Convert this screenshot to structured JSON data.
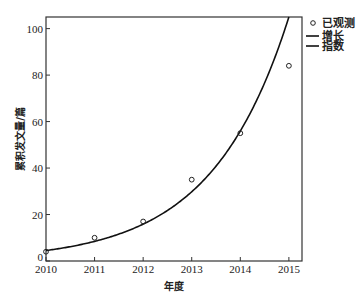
{
  "chart_data": {
    "type": "scatter",
    "title": "",
    "xlabel": "年度",
    "ylabel": "累积发文量/篇",
    "xlim": [
      2010,
      2015.27
    ],
    "ylim": [
      0,
      105
    ],
    "xticks": [
      2010,
      2011,
      2012,
      2013,
      2014,
      2015
    ],
    "yticks": [
      0,
      20,
      40,
      60,
      80,
      100
    ],
    "grid": false,
    "legend_position": "top-right-outside",
    "series": [
      {
        "name": "已观测",
        "type": "scatter",
        "marker": "open-circle",
        "x": [
          2010,
          2011,
          2012,
          2013,
          2014,
          2015
        ],
        "y": [
          4,
          10,
          17,
          35,
          55,
          84
        ]
      },
      {
        "name": "增长",
        "type": "line",
        "model": "exponential",
        "a": 4.5,
        "k": 0.63,
        "x0": 2010
      }
    ],
    "legend": [
      {
        "label": "已观测",
        "marker": "circle"
      },
      {
        "label": "增长",
        "marker": "line"
      },
      {
        "label": "指数",
        "marker": "line"
      }
    ]
  }
}
